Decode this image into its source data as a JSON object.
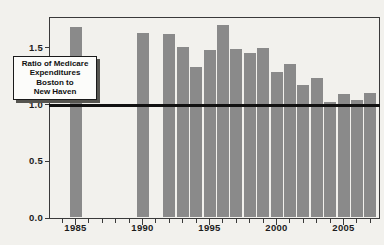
{
  "figure": {
    "background_color": "#f2f1ed",
    "frame_color": "#3a3a3a",
    "tick_color": "#3a3a3a",
    "label_color": "#1c1c1c"
  },
  "chart_data": {
    "type": "bar",
    "title": "Ratio of Medicare Expenditures Boston to New Haven",
    "x": [
      1985,
      1990,
      1992,
      1993,
      1994,
      1995,
      1996,
      1997,
      1998,
      1999,
      2000,
      2001,
      2002,
      2003,
      2004,
      2005,
      2006,
      2007
    ],
    "values": [
      1.68,
      1.63,
      1.62,
      1.51,
      1.33,
      1.48,
      1.7,
      1.49,
      1.45,
      1.5,
      1.29,
      1.36,
      1.17,
      1.23,
      1.02,
      1.09,
      1.04,
      1.1
    ],
    "missing_years": [
      1986,
      1987,
      1988,
      1989,
      1991
    ],
    "xlabel": "",
    "ylabel": "",
    "ylim": [
      0,
      1.76
    ],
    "xlim": [
      1983,
      2007.7
    ],
    "grid": "off",
    "legend": "none",
    "bar_color": "#8a8a8a",
    "y_ticks": [
      0,
      0.5,
      1.0,
      1.5
    ],
    "y_tick_labels": [
      "0.0",
      "0.5",
      "1.0",
      "1.5"
    ],
    "x_major_ticks": [
      1985,
      1990,
      1995,
      2000,
      2005
    ],
    "x_tick_labels": [
      "1985",
      "1990",
      "1995",
      "2000",
      "2005"
    ],
    "x_minor_tick_range": [
      1984,
      2007
    ],
    "reference_line": {
      "y": 1.0,
      "color": "#111111",
      "thickness_px": 3
    },
    "annotation": {
      "text": "Ratio of Medicare Expenditures Boston to New Haven",
      "lines": [
        "Ratio of Medicare",
        "Expenditures",
        "Boston to",
        "New Haven"
      ]
    }
  }
}
